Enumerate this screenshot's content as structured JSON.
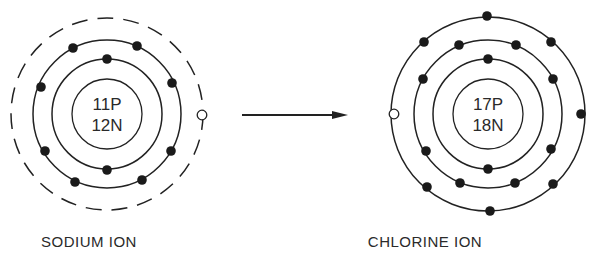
{
  "sodium": {
    "label": "SODIUM ION",
    "protons": "11P",
    "neutrons": "12N",
    "center": [
      107,
      114
    ],
    "shells": [
      {
        "radius": 55,
        "style": "solid",
        "electrons": [
          [
            107,
            59
          ],
          [
            107,
            170
          ]
        ]
      },
      {
        "radius": 74,
        "style": "solid",
        "electrons": [
          [
            73,
            48
          ],
          [
            137,
            46
          ],
          [
            41,
            87
          ],
          [
            172,
            83
          ],
          [
            45,
            151
          ],
          [
            171,
            151
          ],
          [
            75,
            182
          ],
          [
            142,
            180
          ]
        ]
      },
      {
        "radius": 96,
        "style": "dashed",
        "electrons": []
      }
    ],
    "vacancy": [
      202,
      115
    ]
  },
  "chlorine": {
    "label": "CHLORINE ION",
    "protons": "17P",
    "neutrons": "18N",
    "center": [
      488,
      114
    ],
    "shells": [
      {
        "radius": 55,
        "style": "solid",
        "electrons": [
          [
            488,
            59
          ],
          [
            488,
            169
          ]
        ]
      },
      {
        "radius": 74,
        "style": "solid",
        "electrons": [
          [
            459,
            45
          ],
          [
            516,
            45
          ],
          [
            423,
            79
          ],
          [
            553,
            79
          ],
          [
            426,
            151
          ],
          [
            551,
            149
          ],
          [
            460,
            183
          ],
          [
            515,
            183
          ]
        ]
      },
      {
        "radius": 97,
        "style": "solid",
        "electrons": [
          [
            487,
            16
          ],
          [
            424,
            42
          ],
          [
            551,
            42
          ],
          [
            581,
            114
          ],
          [
            427,
            187
          ],
          [
            553,
            184
          ],
          [
            490,
            211
          ]
        ]
      }
    ],
    "vacancy": [
      394,
      114
    ]
  },
  "arrow": {
    "from": [
      242,
      115
    ],
    "to": [
      348,
      115
    ],
    "meaning": "electron transfer"
  },
  "colors": {
    "line": "#222222",
    "electron": "#1a1a1a",
    "background": "#ffffff"
  }
}
